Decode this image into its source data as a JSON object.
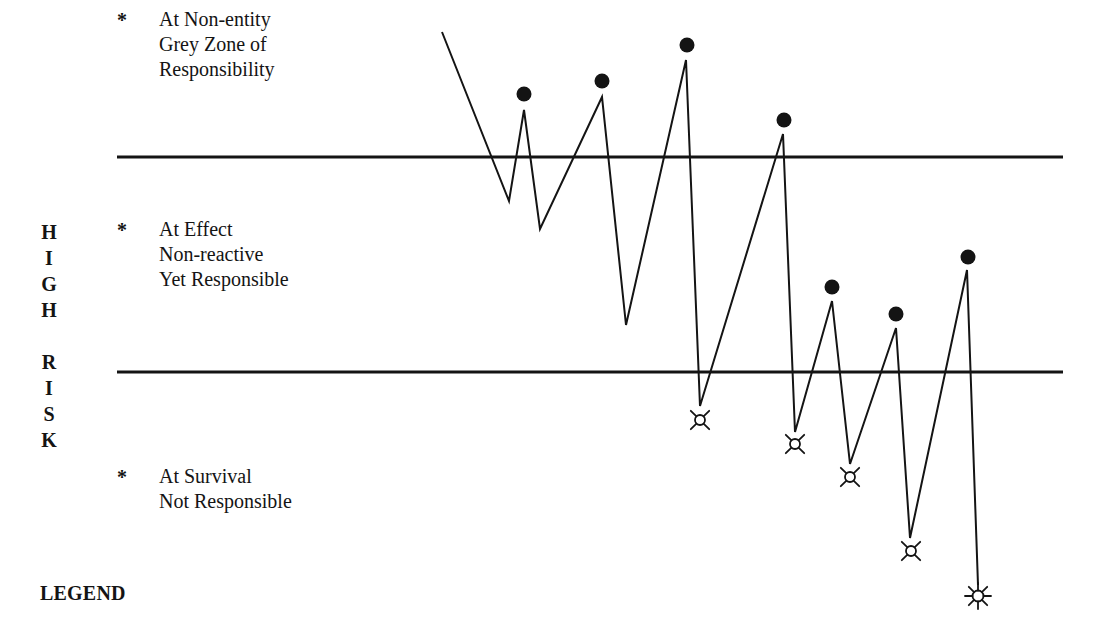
{
  "diagram": {
    "vertical_title": [
      "H",
      "I",
      "G",
      "H",
      "",
      "R",
      "I",
      "S",
      "K"
    ],
    "legend_title": "LEGEND",
    "zones": [
      {
        "id": "non-entity",
        "marker": "*",
        "lines": [
          "At Non-entity",
          "Grey Zone of",
          "Responsibility"
        ]
      },
      {
        "id": "effect",
        "marker": "*",
        "lines": [
          "At Effect",
          "Non-reactive",
          "Yet Responsible"
        ]
      },
      {
        "id": "survival",
        "marker": "*",
        "lines": [
          "At Survival",
          "Not Responsible"
        ]
      }
    ],
    "dividers": [
      {
        "x1": 117,
        "x2": 1063,
        "y": 157
      },
      {
        "x1": 117,
        "x2": 1063,
        "y": 372
      }
    ],
    "path_points": [
      [
        442,
        32
      ],
      [
        509,
        201
      ],
      [
        524,
        110
      ],
      [
        540,
        229
      ],
      [
        602,
        97
      ],
      [
        626,
        325
      ],
      [
        686,
        60
      ],
      [
        700,
        406
      ],
      [
        783,
        134
      ],
      [
        795,
        432
      ],
      [
        832,
        301
      ],
      [
        850,
        464
      ],
      [
        896,
        328
      ],
      [
        910,
        538
      ],
      [
        967,
        270
      ],
      [
        978,
        585
      ]
    ],
    "peak_markers": {
      "symbol": "filled-dot",
      "points": [
        [
          524,
          94
        ],
        [
          602,
          81
        ],
        [
          687,
          45
        ],
        [
          784,
          120
        ],
        [
          832,
          287
        ],
        [
          896,
          314
        ],
        [
          968,
          257
        ]
      ]
    },
    "valley_markers": {
      "symbol": "four-ray-star",
      "points": [
        [
          700,
          420
        ],
        [
          795,
          444
        ],
        [
          850,
          477
        ],
        [
          911,
          551
        ]
      ]
    },
    "end_marker": {
      "symbol": "sun-eight-ray",
      "point": [
        978,
        596
      ]
    },
    "colors": {
      "ink": "#141414",
      "background": "#ffffff"
    }
  }
}
